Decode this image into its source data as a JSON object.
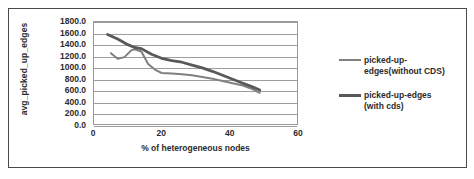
{
  "chart_data": {
    "type": "line",
    "title": "",
    "xlabel": "% of heterogeneous nodes",
    "ylabel": "avg_picked_up_edges",
    "xlim": [
      0,
      60
    ],
    "ylim": [
      0,
      1800
    ],
    "x_ticks": [
      0,
      20,
      40,
      60
    ],
    "x_tick_labels": [
      "0",
      "20",
      "40",
      "60"
    ],
    "y_ticks": [
      0,
      200,
      400,
      600,
      800,
      1000,
      1200,
      1400,
      1600,
      1800
    ],
    "y_tick_labels": [
      "1800.0",
      "1600.0",
      "1400.0",
      "1200.0",
      "1000.0",
      "800.0",
      "600.0",
      "400.0",
      "200.0",
      "0.0"
    ],
    "grid": "horizontal",
    "legend_position": "right",
    "series": [
      {
        "name": "picked-up-edges(without CDS)",
        "color": "#808080",
        "width": 2.0,
        "x": [
          5,
          7,
          9,
          11,
          12,
          14,
          16,
          18,
          20,
          23,
          26,
          29,
          32,
          35,
          38,
          41,
          44,
          47,
          49
        ],
        "values": [
          1250,
          1150,
          1180,
          1300,
          1320,
          1280,
          1060,
          960,
          900,
          890,
          880,
          860,
          830,
          800,
          760,
          720,
          680,
          610,
          550
        ]
      },
      {
        "name": "picked-up-edges (with cds)",
        "color": "#595959",
        "width": 2.8,
        "x": [
          4,
          7,
          10,
          12,
          14,
          17,
          20,
          23,
          26,
          29,
          32,
          35,
          38,
          41,
          44,
          47,
          49
        ],
        "values": [
          1580,
          1500,
          1400,
          1350,
          1330,
          1230,
          1160,
          1120,
          1090,
          1040,
          990,
          930,
          860,
          790,
          720,
          650,
          600
        ]
      }
    ],
    "legend": [
      {
        "label_line1": "picked-up-",
        "label_line2": "edges(without CDS)",
        "color": "#808080",
        "width": 2.0
      },
      {
        "label_line1": "picked-up-edges",
        "label_line2": "(with cds)",
        "color": "#595959",
        "width": 3.0
      }
    ]
  }
}
